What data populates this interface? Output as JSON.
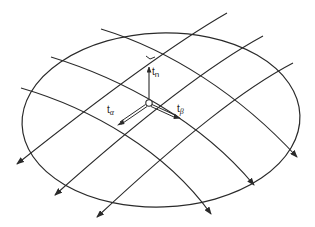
{
  "diagram": {
    "title": "",
    "colors": {
      "stroke": "#2a2a2a",
      "background": "#ffffff"
    },
    "ellipse": {
      "cx": 161,
      "cy": 120,
      "rx": 139,
      "ry": 87,
      "rotation": -2
    },
    "node": {
      "cx": 149,
      "cy": 103,
      "r": 3.2
    },
    "right_angle_marker": {
      "x": 150,
      "y": 57
    },
    "alpha_lines": [
      {
        "d": "M227,13 C180,40 110,90 17,164"
      },
      {
        "d": "M263,36 C215,62 150,110 55,195"
      },
      {
        "d": "M293,63 C245,88 185,135 97,217"
      }
    ],
    "beta_lines": [
      {
        "d": "M101,29 C170,50 240,95 297,157"
      },
      {
        "d": "M51,57 C120,78 200,120 254,185"
      },
      {
        "d": "M21,88 C90,108 165,150 211,214"
      }
    ],
    "vectors": {
      "t_n": {
        "base": "t",
        "sub": "n",
        "from": [
          149,
          99
        ],
        "to": [
          149,
          67
        ]
      },
      "t_alpha": {
        "base": "t",
        "sub": "α",
        "from": [
          146,
          106
        ],
        "to": [
          119,
          124
        ]
      },
      "t_beta": {
        "base": "t",
        "sub": "β",
        "from": [
          152,
          106
        ],
        "to": [
          180,
          118
        ]
      }
    },
    "labels": {
      "t_n": {
        "base": "t",
        "sub": "n"
      },
      "t_alpha": {
        "base": "t",
        "sub": "α"
      },
      "t_beta": {
        "base": "t",
        "sub": "β"
      }
    }
  }
}
